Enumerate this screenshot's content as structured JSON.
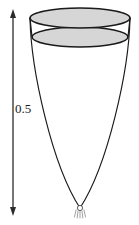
{
  "figure": {
    "dimension": {
      "label": "0.5",
      "orientation": "vertical",
      "arrow_style": "double-headed"
    },
    "colors": {
      "outline": "#1a1a1a",
      "surface_fill": "#d6d6d6",
      "background": "#ffffff",
      "arrow": "#2b2b2b"
    },
    "parts": {
      "top_rim_label": "top-ellipse-rim",
      "liquid_surface_label": "liquid-surface-ellipse",
      "wall_label": "parabolic-wall",
      "vertex_label": "bottom-vertex-fitting"
    },
    "geometry": {
      "top_ellipse": {
        "cx": 80,
        "cy": 18,
        "rx": 50,
        "ry": 10
      },
      "surface_ellipse": {
        "cx": 80,
        "cy": 37,
        "rx": 48,
        "ry": 10
      },
      "vertex": {
        "x": 80,
        "y": 208,
        "r": 2.6
      },
      "arrow_x": 13,
      "arrow_top_y": 10,
      "arrow_bottom_y": 215
    }
  }
}
